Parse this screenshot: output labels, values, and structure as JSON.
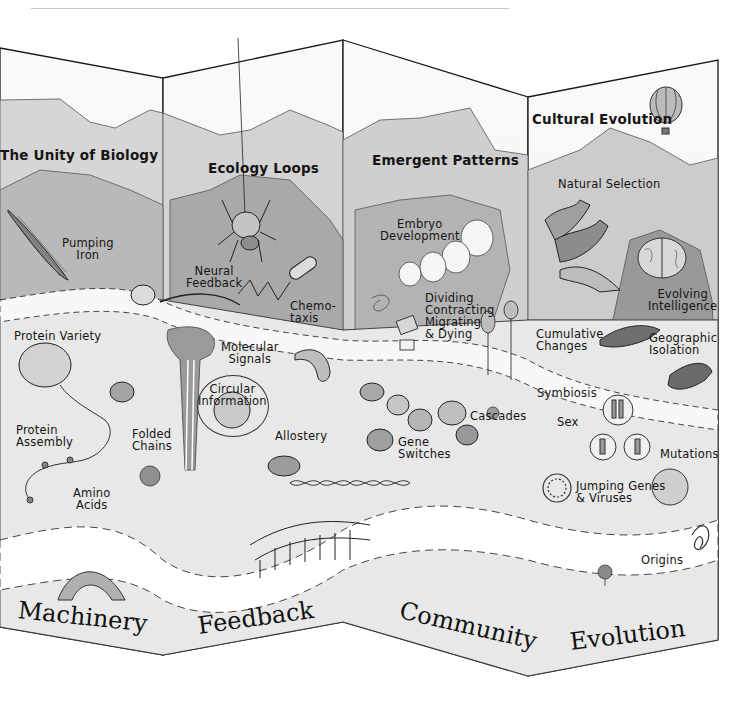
{
  "figure": {
    "panels": [
      {
        "id": "machinery",
        "footer": "Machinery",
        "title": "The Unity of Biology",
        "labels": [
          "Pumping\nIron",
          "Protein Variety",
          "Protein\nAssembly",
          "Folded\nChains",
          "Amino\nAcids"
        ]
      },
      {
        "id": "feedback",
        "footer": "Feedback",
        "title": "Ecology Loops",
        "labels": [
          "Neural\nFeedback",
          "Chemo-\ntaxis",
          "Molecular\nSignals",
          "Circular\nInformation",
          "Allostery"
        ]
      },
      {
        "id": "community",
        "footer": "Community",
        "title": "Emergent Patterns",
        "labels": [
          "Embryo\nDevelopment",
          "Dividing\nContracting\nMigrating\n& Dying",
          "Cascades",
          "Gene\nSwitches"
        ]
      },
      {
        "id": "evolution",
        "footer": "Evolution",
        "title": "Cultural Evolution",
        "labels": [
          "Natural Selection",
          "Evolving\nIntelligence",
          "Cumulative\nChanges",
          "Geographic\nIsolation",
          "Symbiosis",
          "Sex",
          "Mutations",
          "Jumping Genes\n& Viruses",
          "Origins"
        ]
      }
    ],
    "icons": [
      "muscle-icon",
      "spider-icon",
      "embryo-icon",
      "hot-air-balloon-icon",
      "brain-icon",
      "bird-icon",
      "dna-helix-icon",
      "bridge-icon",
      "chromosome-icon",
      "tree-icon"
    ],
    "colors": {
      "ink": "#151515",
      "wash_light": "#e6e6e6",
      "wash_mid": "#c9c9c9",
      "wash_dark": "#9d9d9d",
      "paper": "#f3f3f3"
    }
  }
}
